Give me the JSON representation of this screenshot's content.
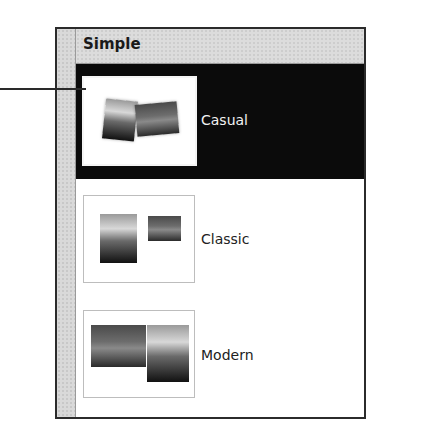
{
  "panel": {
    "header": {
      "title": "Simple"
    },
    "items": [
      {
        "label": "Casual",
        "selected": true,
        "thumbnail": "casual-layout-icon"
      },
      {
        "label": "Classic",
        "selected": false,
        "thumbnail": "classic-layout-icon"
      },
      {
        "label": "Modern",
        "selected": false,
        "thumbnail": "modern-layout-icon"
      }
    ]
  },
  "colors": {
    "selected_background": "#0b0b0b",
    "header_background": "#dcdcdc",
    "frame": "#2b2b2b"
  }
}
